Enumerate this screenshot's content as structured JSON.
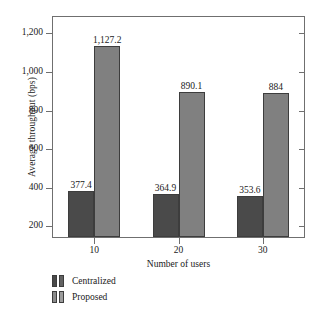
{
  "chart_data": {
    "type": "bar",
    "title": "",
    "xlabel": "Number of users",
    "ylabel": "Average throughput (bps)",
    "categories": [
      "10",
      "20",
      "30"
    ],
    "series": [
      {
        "name": "Centralized",
        "values": [
          377.4,
          364.9,
          353.6
        ],
        "color": "#4a4a4a",
        "labels": [
          "377.4",
          "364.9",
          "353.6"
        ]
      },
      {
        "name": "Proposed",
        "values": [
          1127.2,
          890.1,
          884
        ],
        "color": "#808080",
        "labels": [
          "1,127.2",
          "890.1",
          "884"
        ]
      }
    ],
    "ylim": [
      140,
      1290
    ],
    "yticks": [
      200,
      400,
      600,
      800,
      1000,
      1200
    ],
    "ytick_labels": [
      "200",
      "400",
      "600",
      "800",
      "1,000",
      "1,200"
    ],
    "grid": false,
    "legend_position": "below-plot-left",
    "frame": true
  },
  "legend": {
    "entries": [
      {
        "label": "Centralized"
      },
      {
        "label": "Proposed"
      }
    ]
  }
}
